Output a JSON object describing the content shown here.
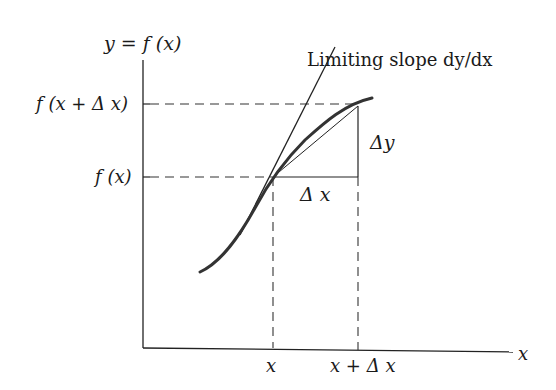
{
  "diagram": {
    "y_axis_label": "y = f (x)",
    "x_axis_label": "x",
    "tangent_label": "Limiting slope dy/dx",
    "y_ticks": [
      "f (x + Δ x)",
      "f (x)"
    ],
    "x_ticks": [
      "x",
      "x + Δ x"
    ],
    "delta_x_label": "Δ x",
    "delta_y_label": "Δy"
  }
}
